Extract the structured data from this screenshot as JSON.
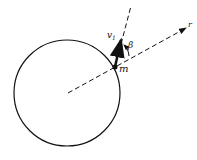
{
  "diagram": {
    "type": "physics-diagram",
    "labels": {
      "velocity": "v",
      "velocity_subscript": "1",
      "angle": "β",
      "mass": "m",
      "radial": "r"
    },
    "colors": {
      "stroke": "#111111",
      "background": "#ffffff"
    }
  }
}
